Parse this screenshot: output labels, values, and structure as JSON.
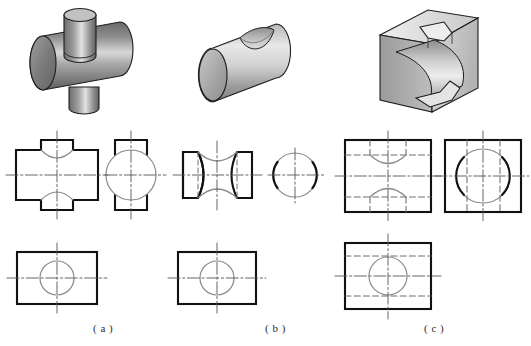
{
  "figure": {
    "background_color": "#ffffff",
    "line_colors": {
      "visible_outline": "#1a1a1a",
      "visible_thin": "#8c8c8c",
      "hidden_dashed": "#6e6e6e",
      "center_line": "#5a5a5a",
      "shade_dark": "#5c5c5c",
      "shade_mid": "#9a9a9a",
      "shade_light": "#d2d2d2"
    },
    "columns": [
      {
        "key": "a",
        "caption": "( a )",
        "caption_x": 93,
        "caption_y": 322,
        "pictorial": "horizontal cylinder with smaller vertical cylinder passing through it",
        "views": [
          {
            "name": "front-view",
            "shape": "cross / plus outline with concave arcs at top and bottom notches"
          },
          {
            "name": "side-view",
            "shape": "circle with rectangular projections top and bottom"
          },
          {
            "name": "top-view",
            "shape": "rectangle with centered circle"
          }
        ]
      },
      {
        "key": "b",
        "caption": "( b )",
        "caption_x": 265,
        "caption_y": 322,
        "pictorial": "horizontal cylinder with a cylindrical groove cut into its upper surface",
        "views": [
          {
            "name": "front-view",
            "shape": "rectangle with concave arcs cut into top and bottom, hidden vertical lines"
          },
          {
            "name": "side-view",
            "shape": "circle with thick arcs at left and right"
          },
          {
            "name": "top-view",
            "shape": "rectangle with centered circle"
          }
        ]
      },
      {
        "key": "c",
        "caption": "( c )",
        "caption_x": 424,
        "caption_y": 322,
        "pictorial": "rectangular block with a large cylindrical through-cut and stepped notches",
        "views": [
          {
            "name": "front-view",
            "shape": "rectangle with hidden horizontal lines and concave arcs top and bottom"
          },
          {
            "name": "side-view",
            "shape": "square with large circle and hidden vertical lines"
          },
          {
            "name": "top-view",
            "shape": "rectangle with centered circle and hidden horizontal lines"
          }
        ]
      }
    ]
  },
  "chart_data": {
    "type": "diagram",
    "labels": [
      "( a )",
      "( b )",
      "( c )"
    ]
  }
}
